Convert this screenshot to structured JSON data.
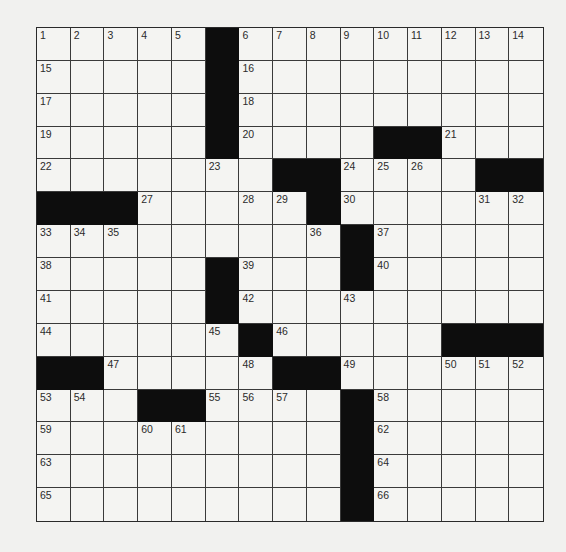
{
  "puzzle": {
    "rows": 15,
    "cols": 15,
    "colors": {
      "black": "#0d0d0d",
      "white": "#f4f4f2",
      "line": "#3a3a3a",
      "number": "#2b2b2b"
    },
    "layout": [
      ".....#.........",
      ".....#.........",
      ".....#.........",
      ".....#....##...",
      ".......##.....##",
      "###.....#......",
      ".........#.....",
      ".....#...#.....",
      ".....#.........",
      "......#.....###",
      "##.....##......",
      "...##....#.....",
      ".........#.....",
      ".........#.....",
      ".........#....."
    ],
    "black_cells": [
      [
        0,
        5
      ],
      [
        1,
        5
      ],
      [
        2,
        5
      ],
      [
        3,
        5
      ],
      [
        3,
        10
      ],
      [
        3,
        11
      ],
      [
        4,
        7
      ],
      [
        4,
        8
      ],
      [
        4,
        13
      ],
      [
        4,
        14
      ],
      [
        5,
        0
      ],
      [
        5,
        1
      ],
      [
        5,
        2
      ],
      [
        5,
        8
      ],
      [
        6,
        9
      ],
      [
        7,
        5
      ],
      [
        7,
        9
      ],
      [
        8,
        5
      ],
      [
        9,
        6
      ],
      [
        9,
        12
      ],
      [
        9,
        13
      ],
      [
        9,
        14
      ],
      [
        10,
        0
      ],
      [
        10,
        1
      ],
      [
        10,
        7
      ],
      [
        10,
        8
      ],
      [
        11,
        3
      ],
      [
        11,
        4
      ],
      [
        11,
        9
      ],
      [
        12,
        9
      ],
      [
        13,
        9
      ],
      [
        14,
        9
      ]
    ],
    "numbers": [
      {
        "r": 0,
        "c": 0,
        "n": "1"
      },
      {
        "r": 0,
        "c": 1,
        "n": "2"
      },
      {
        "r": 0,
        "c": 2,
        "n": "3"
      },
      {
        "r": 0,
        "c": 3,
        "n": "4"
      },
      {
        "r": 0,
        "c": 4,
        "n": "5"
      },
      {
        "r": 0,
        "c": 6,
        "n": "6"
      },
      {
        "r": 0,
        "c": 7,
        "n": "7"
      },
      {
        "r": 0,
        "c": 8,
        "n": "8"
      },
      {
        "r": 0,
        "c": 9,
        "n": "9"
      },
      {
        "r": 0,
        "c": 10,
        "n": "10"
      },
      {
        "r": 0,
        "c": 11,
        "n": "11"
      },
      {
        "r": 0,
        "c": 12,
        "n": "12"
      },
      {
        "r": 0,
        "c": 13,
        "n": "13"
      },
      {
        "r": 0,
        "c": 14,
        "n": "14"
      },
      {
        "r": 1,
        "c": 0,
        "n": "15"
      },
      {
        "r": 1,
        "c": 6,
        "n": "16"
      },
      {
        "r": 2,
        "c": 0,
        "n": "17"
      },
      {
        "r": 2,
        "c": 6,
        "n": "18"
      },
      {
        "r": 3,
        "c": 0,
        "n": "19"
      },
      {
        "r": 3,
        "c": 6,
        "n": "20"
      },
      {
        "r": 3,
        "c": 12,
        "n": "21"
      },
      {
        "r": 4,
        "c": 0,
        "n": "22"
      },
      {
        "r": 4,
        "c": 5,
        "n": "23"
      },
      {
        "r": 4,
        "c": 9,
        "n": "24"
      },
      {
        "r": 4,
        "c": 10,
        "n": "25"
      },
      {
        "r": 4,
        "c": 11,
        "n": "26"
      },
      {
        "r": 5,
        "c": 3,
        "n": "27"
      },
      {
        "r": 5,
        "c": 6,
        "n": "28"
      },
      {
        "r": 5,
        "c": 7,
        "n": "29"
      },
      {
        "r": 5,
        "c": 9,
        "n": "30"
      },
      {
        "r": 5,
        "c": 13,
        "n": "31"
      },
      {
        "r": 5,
        "c": 14,
        "n": "32"
      },
      {
        "r": 6,
        "c": 0,
        "n": "33"
      },
      {
        "r": 6,
        "c": 1,
        "n": "34"
      },
      {
        "r": 6,
        "c": 2,
        "n": "35"
      },
      {
        "r": 6,
        "c": 8,
        "n": "36"
      },
      {
        "r": 6,
        "c": 10,
        "n": "37"
      },
      {
        "r": 7,
        "c": 0,
        "n": "38"
      },
      {
        "r": 7,
        "c": 6,
        "n": "39"
      },
      {
        "r": 7,
        "c": 10,
        "n": "40"
      },
      {
        "r": 8,
        "c": 0,
        "n": "41"
      },
      {
        "r": 8,
        "c": 6,
        "n": "42"
      },
      {
        "r": 8,
        "c": 9,
        "n": "43"
      },
      {
        "r": 9,
        "c": 0,
        "n": "44"
      },
      {
        "r": 9,
        "c": 5,
        "n": "45"
      },
      {
        "r": 9,
        "c": 7,
        "n": "46"
      },
      {
        "r": 10,
        "c": 2,
        "n": "47"
      },
      {
        "r": 10,
        "c": 6,
        "n": "48"
      },
      {
        "r": 10,
        "c": 9,
        "n": "49"
      },
      {
        "r": 10,
        "c": 12,
        "n": "50"
      },
      {
        "r": 10,
        "c": 13,
        "n": "51"
      },
      {
        "r": 10,
        "c": 14,
        "n": "52"
      },
      {
        "r": 11,
        "c": 0,
        "n": "53"
      },
      {
        "r": 11,
        "c": 1,
        "n": "54"
      },
      {
        "r": 11,
        "c": 5,
        "n": "55"
      },
      {
        "r": 11,
        "c": 6,
        "n": "56"
      },
      {
        "r": 11,
        "c": 7,
        "n": "57"
      },
      {
        "r": 11,
        "c": 10,
        "n": "58"
      },
      {
        "r": 12,
        "c": 0,
        "n": "59"
      },
      {
        "r": 12,
        "c": 3,
        "n": "60"
      },
      {
        "r": 12,
        "c": 4,
        "n": "61"
      },
      {
        "r": 12,
        "c": 10,
        "n": "62"
      },
      {
        "r": 13,
        "c": 0,
        "n": "63"
      },
      {
        "r": 13,
        "c": 10,
        "n": "64"
      },
      {
        "r": 14,
        "c": 0,
        "n": "65"
      },
      {
        "r": 14,
        "c": 10,
        "n": "66"
      }
    ]
  }
}
